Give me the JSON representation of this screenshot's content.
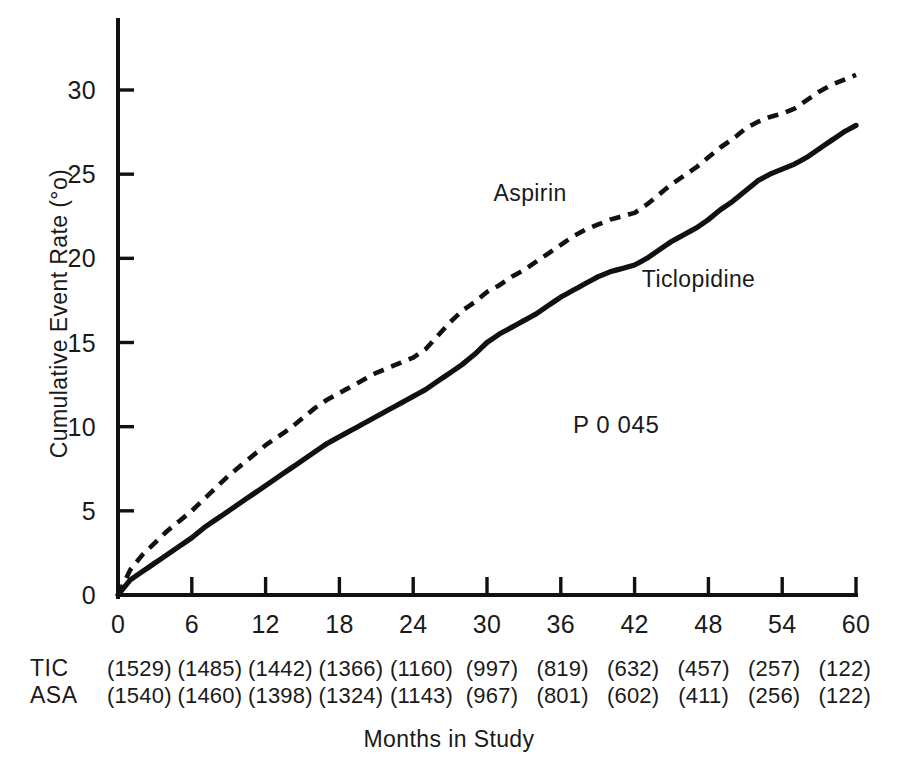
{
  "chart_data": {
    "type": "line",
    "title": "",
    "xlabel": "Months in Study",
    "ylabel": "Cumulative Event Rate (°o)",
    "xlim": [
      0,
      60
    ],
    "ylim": [
      0,
      33
    ],
    "grid": false,
    "legend_position": "inline-annotation",
    "xticks": [
      0,
      6,
      12,
      18,
      24,
      30,
      36,
      42,
      48,
      54,
      60
    ],
    "xtick_labels": [
      "0",
      "6",
      "12",
      "18",
      "24",
      "30",
      "36",
      "42",
      "48",
      "54",
      "60"
    ],
    "yticks": [
      0,
      5,
      10,
      15,
      20,
      25,
      30
    ],
    "ytick_labels": [
      "0",
      "5",
      "10",
      "15",
      "20",
      "25",
      "30"
    ],
    "annotations": [
      {
        "text": "Aspirin",
        "x": 33.5,
        "y": 23.4
      },
      {
        "text": "Ticlopidine",
        "x": 47.2,
        "y": 18.3
      },
      {
        "text": "P  0 045",
        "x": 40.5,
        "y": 9.6
      }
    ],
    "series": [
      {
        "name": "Aspirin",
        "style": "dashed",
        "color": "#111111",
        "end_value": 30.9,
        "x": [
          0,
          1,
          2,
          3,
          4,
          5,
          6,
          7,
          8,
          9,
          10,
          11,
          12,
          13,
          14,
          15,
          16,
          17,
          18,
          19,
          20,
          21,
          22,
          23,
          24,
          25,
          26,
          27,
          28,
          29,
          30,
          31,
          32,
          33,
          34,
          35,
          36,
          37,
          38,
          39,
          40,
          41,
          42,
          43,
          44,
          45,
          46,
          47,
          48,
          49,
          50,
          51,
          52,
          53,
          54,
          55,
          56,
          57,
          58,
          59,
          60
        ],
        "values": [
          0.0,
          1.5,
          2.4,
          3.1,
          3.8,
          4.4,
          5.0,
          5.7,
          6.4,
          7.1,
          7.7,
          8.3,
          8.9,
          9.4,
          9.9,
          10.5,
          11.1,
          11.6,
          12.0,
          12.4,
          12.8,
          13.2,
          13.5,
          13.8,
          14.1,
          14.6,
          15.4,
          16.2,
          16.9,
          17.4,
          18.0,
          18.4,
          18.9,
          19.3,
          19.8,
          20.3,
          20.8,
          21.3,
          21.7,
          22.0,
          22.3,
          22.5,
          22.7,
          23.2,
          23.8,
          24.4,
          24.9,
          25.4,
          26.0,
          26.6,
          27.1,
          27.7,
          28.1,
          28.4,
          28.6,
          28.9,
          29.4,
          29.9,
          30.3,
          30.6,
          30.9
        ]
      },
      {
        "name": "Ticlopidine",
        "style": "solid",
        "color": "#111111",
        "end_value": 27.9,
        "x": [
          0,
          1,
          2,
          3,
          4,
          5,
          6,
          7,
          8,
          9,
          10,
          11,
          12,
          13,
          14,
          15,
          16,
          17,
          18,
          19,
          20,
          21,
          22,
          23,
          24,
          25,
          26,
          27,
          28,
          29,
          30,
          31,
          32,
          33,
          34,
          35,
          36,
          37,
          38,
          39,
          40,
          41,
          42,
          43,
          44,
          45,
          46,
          47,
          48,
          49,
          50,
          51,
          52,
          53,
          54,
          55,
          56,
          57,
          58,
          59,
          60
        ],
        "values": [
          0.0,
          0.9,
          1.4,
          1.9,
          2.4,
          2.9,
          3.4,
          4.0,
          4.5,
          5.0,
          5.5,
          6.0,
          6.5,
          7.0,
          7.5,
          8.0,
          8.5,
          9.0,
          9.4,
          9.8,
          10.2,
          10.6,
          11.0,
          11.4,
          11.8,
          12.2,
          12.7,
          13.2,
          13.7,
          14.3,
          15.0,
          15.5,
          15.9,
          16.3,
          16.7,
          17.2,
          17.7,
          18.1,
          18.5,
          18.9,
          19.2,
          19.4,
          19.6,
          20.0,
          20.5,
          21.0,
          21.4,
          21.8,
          22.3,
          22.9,
          23.4,
          24.0,
          24.6,
          25.0,
          25.3,
          25.6,
          26.0,
          26.5,
          27.0,
          27.5,
          27.9
        ]
      }
    ],
    "at_risk_table": {
      "columns": [
        "0",
        "6",
        "12",
        "18",
        "24",
        "30",
        "36",
        "42",
        "48",
        "54",
        "60"
      ],
      "rows": [
        {
          "label": "TIC",
          "values": [
            "(1529)",
            "(1485)",
            "(1442)",
            "(1366)",
            "(1160)",
            "(997)",
            "(819)",
            "(632)",
            "(457)",
            "(257)",
            "(122)"
          ]
        },
        {
          "label": "ASA",
          "values": [
            "(1540)",
            "(1460)",
            "(1398)",
            "(1324)",
            "(1143)",
            "(967)",
            "(801)",
            "(602)",
            "(411)",
            "(256)",
            "(122)"
          ]
        }
      ]
    }
  }
}
